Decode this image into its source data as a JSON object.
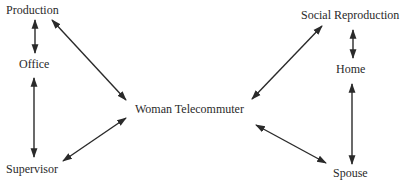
{
  "diagram": {
    "nodes": {
      "production": "Production",
      "office": "Office",
      "supervisor": "Supervisor",
      "woman_telecommuter": "Woman Telecommuter",
      "social_reproduction": "Social Reproduction",
      "home": "Home",
      "spouse": "Spouse"
    },
    "edges": [
      {
        "from": "Production",
        "to": "Office",
        "type": "bidirectional"
      },
      {
        "from": "Office",
        "to": "Supervisor",
        "type": "bidirectional"
      },
      {
        "from": "Production",
        "to": "Woman Telecommuter",
        "type": "bidirectional"
      },
      {
        "from": "Supervisor",
        "to": "Woman Telecommuter",
        "type": "bidirectional"
      },
      {
        "from": "Social Reproduction",
        "to": "Home",
        "type": "bidirectional"
      },
      {
        "from": "Home",
        "to": "Spouse",
        "type": "bidirectional"
      },
      {
        "from": "Social Reproduction",
        "to": "Woman Telecommuter",
        "type": "bidirectional"
      },
      {
        "from": "Spouse",
        "to": "Woman Telecommuter",
        "type": "bidirectional"
      }
    ],
    "line_color": "#2a2a2a"
  }
}
